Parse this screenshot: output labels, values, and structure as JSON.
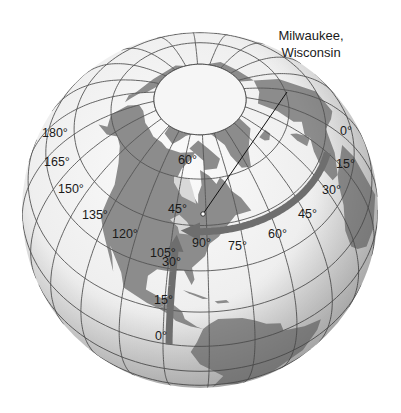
{
  "figure": {
    "callout": {
      "line1": "Milwaukee,",
      "line2": "Wisconsin"
    },
    "location": {
      "name": "Milwaukee, Wisconsin",
      "latitude": 43,
      "longitude": -88
    },
    "longitude_labels": [
      "180°",
      "165°",
      "150°",
      "135°",
      "120°",
      "105°",
      "90°",
      "75°",
      "60°",
      "45°",
      "30°",
      "15°",
      "0°"
    ],
    "latitude_labels": [
      "60°",
      "45°",
      "30°",
      "15°",
      "0°"
    ],
    "colors": {
      "ocean_light": "#f4f4f4",
      "ocean_shade": "#c9c9c9",
      "land": "#8c8c8c",
      "grid": "#555555",
      "arrow": "#6e6e6e",
      "text": "#1a1a1a"
    }
  }
}
